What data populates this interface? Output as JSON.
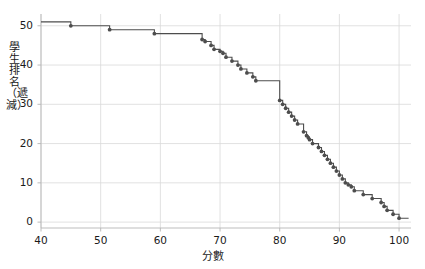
{
  "chart_data": {
    "type": "line",
    "subtype": "step-descending",
    "title": "",
    "xlabel": "分數",
    "ylabel": "學生排名（遞減）",
    "xlim": [
      40,
      102
    ],
    "ylim": [
      -1.5,
      53
    ],
    "xticks": [
      40,
      50,
      60,
      70,
      80,
      90,
      100
    ],
    "xticklabels": [
      "40",
      "50",
      "60",
      "70",
      "80",
      "90",
      "100"
    ],
    "yticks": [
      0,
      10,
      20,
      30,
      40,
      50
    ],
    "yticklabels": [
      "0",
      "10",
      "20",
      "30",
      "40",
      "50"
    ],
    "grid": true,
    "grid_color": "#d9d9d9",
    "legend": null,
    "line_color": "#4d4d4d",
    "marker_color": "#4d4d4d",
    "marker": "circle",
    "x": [
      45,
      51.5,
      59,
      67,
      67.5,
      68.5,
      69,
      70,
      70.5,
      71,
      72,
      73,
      73.5,
      74.5,
      75.5,
      76,
      80,
      80.5,
      81,
      81.5,
      82,
      82.5,
      83,
      84,
      84.5,
      84.8,
      85,
      85.5,
      86.5,
      87,
      87.5,
      88,
      88.5,
      89,
      89.5,
      90,
      90.5,
      91,
      91.5,
      92,
      92.5,
      94,
      95.5,
      97,
      97.5,
      98,
      99,
      100
    ],
    "y": [
      50,
      49,
      48,
      46.5,
      46,
      45,
      44,
      43.5,
      43,
      42,
      41,
      40,
      39,
      38,
      37,
      36,
      31,
      30,
      29,
      28,
      27,
      26,
      25,
      23,
      22,
      21.5,
      21,
      20,
      19,
      18,
      17,
      16,
      15,
      14,
      13,
      12,
      11,
      10,
      9.5,
      9,
      8,
      7,
      6,
      5,
      4,
      3,
      2,
      1
    ],
    "n_points": 48,
    "start_y": 51
  }
}
